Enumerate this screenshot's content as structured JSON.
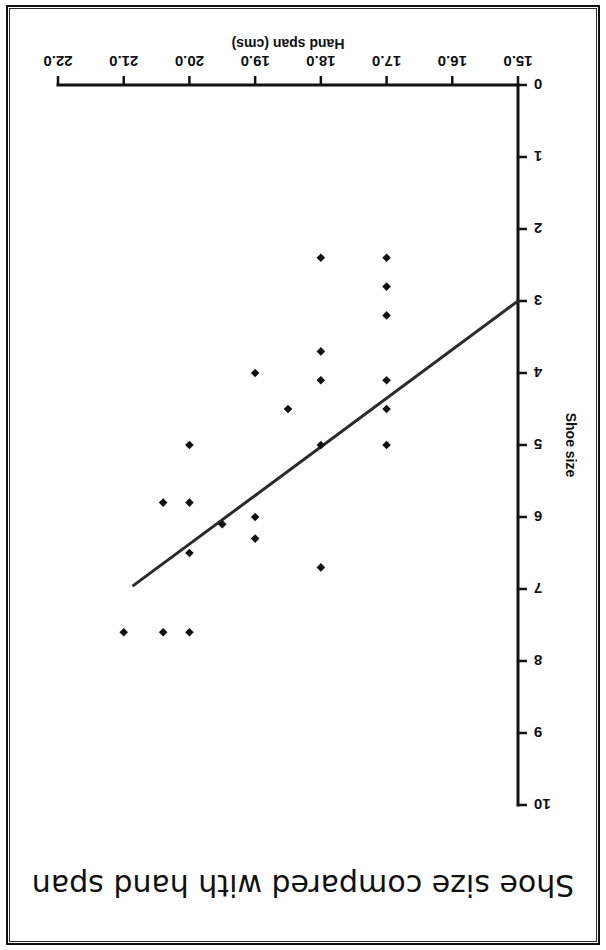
{
  "page": {
    "background": "#ffffff",
    "border_color": "#111111",
    "orientation_note": "rotated-180"
  },
  "chart_data": {
    "type": "scatter",
    "title": "Shoe size compared with hand span",
    "xlabel": "Hand span (cms)",
    "ylabel": "Shoe size",
    "xlim": [
      15.0,
      22.0
    ],
    "ylim": [
      0,
      10
    ],
    "xticks": [
      "15.0",
      "16.0",
      "17.0",
      "18.0",
      "19.0",
      "20.0",
      "21.0",
      "22.0"
    ],
    "xtick_values": [
      15.0,
      16.0,
      17.0,
      18.0,
      19.0,
      20.0,
      21.0,
      22.0
    ],
    "yticks": [
      "0",
      "1",
      "2",
      "3",
      "4",
      "5",
      "6",
      "7",
      "8",
      "9",
      "10"
    ],
    "ytick_values": [
      0,
      1,
      2,
      3,
      4,
      5,
      6,
      7,
      8,
      9,
      10
    ],
    "grid": false,
    "legend": null,
    "marker": "diamond",
    "marker_color": "#111111",
    "points": [
      {
        "x": 17.0,
        "y": 5.0
      },
      {
        "x": 17.0,
        "y": 4.5
      },
      {
        "x": 17.0,
        "y": 4.1
      },
      {
        "x": 17.0,
        "y": 3.2
      },
      {
        "x": 17.0,
        "y": 2.8
      },
      {
        "x": 17.0,
        "y": 2.4
      },
      {
        "x": 18.0,
        "y": 6.7
      },
      {
        "x": 18.0,
        "y": 5.0
      },
      {
        "x": 18.0,
        "y": 4.1
      },
      {
        "x": 18.0,
        "y": 3.7
      },
      {
        "x": 18.0,
        "y": 2.4
      },
      {
        "x": 18.5,
        "y": 4.5
      },
      {
        "x": 19.0,
        "y": 6.3
      },
      {
        "x": 19.0,
        "y": 6.0
      },
      {
        "x": 19.0,
        "y": 4.0
      },
      {
        "x": 19.5,
        "y": 6.1
      },
      {
        "x": 20.0,
        "y": 7.6
      },
      {
        "x": 20.0,
        "y": 6.5
      },
      {
        "x": 20.0,
        "y": 5.8
      },
      {
        "x": 20.0,
        "y": 5.0
      },
      {
        "x": 20.4,
        "y": 7.6
      },
      {
        "x": 20.4,
        "y": 5.8
      },
      {
        "x": 21.0,
        "y": 7.6
      }
    ],
    "trend_line": {
      "label": "line of best fit",
      "color": "#2b2b2b",
      "x_start": 15.0,
      "y_start": 3.0,
      "x_end": 20.85,
      "y_end": 6.95
    }
  }
}
